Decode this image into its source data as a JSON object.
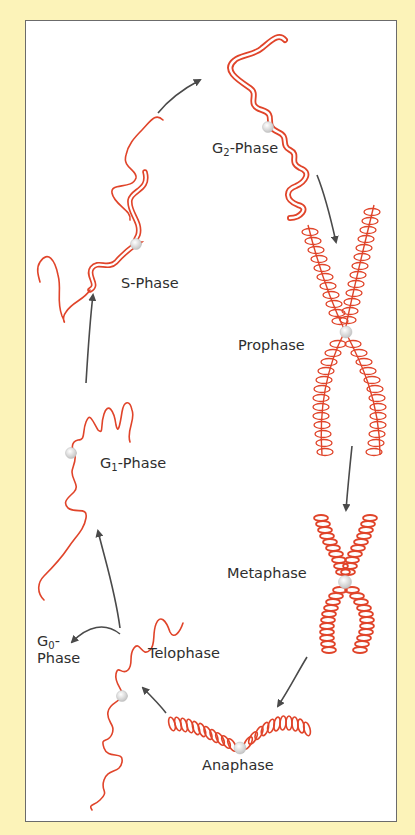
{
  "diagram": {
    "colors": {
      "background": "#fcf3b9",
      "panel": "#ffffff",
      "border": "#6b6b6b",
      "chromosome": "#e0442a",
      "arrow": "#4a4a4a",
      "centromere": "#e6e6e6",
      "text": "#2e2e2e"
    },
    "phases": [
      {
        "id": "g2",
        "prefix": "G",
        "sub": "2",
        "suffix": "-Phase"
      },
      {
        "id": "s",
        "label": "S-Phase"
      },
      {
        "id": "prophase",
        "label": "Prophase"
      },
      {
        "id": "g1",
        "prefix": "G",
        "sub": "1",
        "suffix": "-Phase"
      },
      {
        "id": "metaphase",
        "label": "Metaphase"
      },
      {
        "id": "g0",
        "prefix": "G",
        "sub": "0",
        "suffix": "-",
        "line2": "Phase"
      },
      {
        "id": "telophase",
        "label": "Telophase"
      },
      {
        "id": "anaphase",
        "label": "Anaphase"
      }
    ],
    "cycle_order": [
      "G1-Phase",
      "S-Phase",
      "G2-Phase",
      "Prophase",
      "Metaphase",
      "Anaphase",
      "Telophase",
      "G1-Phase"
    ],
    "branch": {
      "from": "Telophase",
      "to": "G0-Phase"
    }
  }
}
